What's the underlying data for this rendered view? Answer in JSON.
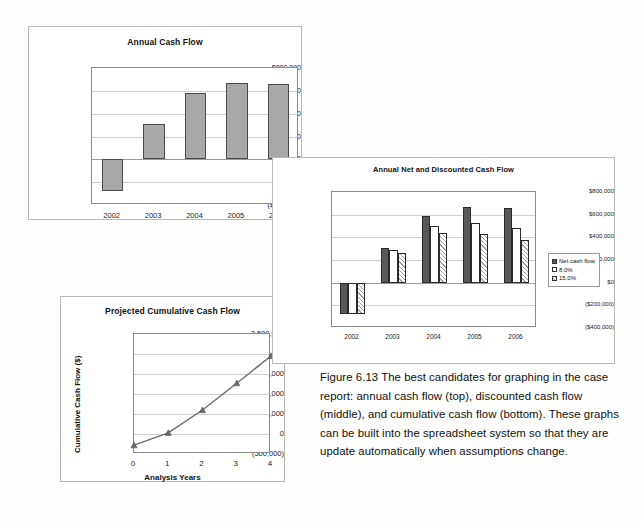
{
  "figure": {
    "caption": "Figure 6.13 The best candidates for graphing in the case report: annual cash flow (top), discounted cash flow (middle), and cumulative cash flow (bottom). These graphs can be built into the spreadsheet system so that they are update automatically when assumptions change."
  },
  "chart_data": [
    {
      "id": "annual-cash-flow",
      "type": "bar",
      "title": "Annual Cash Flow",
      "xlabel": "",
      "ylabel": "",
      "categories": [
        "2002",
        "2003",
        "2004",
        "2005",
        "2006"
      ],
      "values": [
        -280000,
        310000,
        585000,
        665000,
        660000
      ],
      "ylim": [
        -400000,
        800000
      ],
      "ytick_values": [
        800000,
        600000,
        400000,
        200000,
        0,
        -200000,
        -400000
      ],
      "ytick_labels": [
        "$800,000",
        "$600,000",
        "$400,000",
        "$200,000",
        "$0",
        "($200,000)",
        "($400,000)"
      ],
      "grid": true,
      "legend": false,
      "series_color": "#a8a8a8",
      "clipped_last_label": "200"
    },
    {
      "id": "annual-net-and-discounted-cash-flow",
      "type": "bar",
      "title": "Annual Net and Discounted Cash Flow",
      "xlabel": "",
      "ylabel": "",
      "categories": [
        "2002",
        "2003",
        "2004",
        "2005",
        "2006"
      ],
      "series": [
        {
          "name": "Net cash flow",
          "values": [
            -280000,
            310000,
            585000,
            665000,
            660000
          ],
          "color": "#595959"
        },
        {
          "name": "8.0%",
          "values": [
            -280000,
            285000,
            500000,
            525000,
            485000
          ],
          "color": "#ffffff"
        },
        {
          "name": "15.0%",
          "values": [
            -280000,
            265000,
            440000,
            430000,
            380000
          ],
          "color": "#d8d8d8"
        }
      ],
      "ylim": [
        -400000,
        800000
      ],
      "ytick_values": [
        800000,
        600000,
        400000,
        200000,
        0,
        -200000,
        -400000
      ],
      "ytick_labels": [
        "$800,000",
        "$600,000",
        "$400,000",
        "$200,000",
        "$0",
        "($200,000)",
        "($400,000)"
      ],
      "grid": true,
      "legend": true,
      "legend_position": "right"
    },
    {
      "id": "projected-cumulative-cash-flow",
      "type": "line",
      "title": "Projected Cumulative Cash Flow",
      "xlabel": "Analysis Years",
      "ylabel": "Cumulative Cash Flow ($)",
      "x": [
        0,
        1,
        2,
        3,
        4
      ],
      "xtick_labels": [
        "0",
        "1",
        "2",
        "3",
        "4"
      ],
      "values": [
        -280000,
        30000,
        600000,
        1270000,
        1950000
      ],
      "ylim": [
        -500000,
        2500000
      ],
      "ytick_values": [
        2500000,
        2000000,
        1500000,
        1000000,
        500000,
        0,
        -500000
      ],
      "ytick_labels": [
        "2,500,000",
        "2,000,000",
        "1,500,000",
        "1,000,000",
        "500,000",
        "0",
        "(500,000)"
      ],
      "grid": true,
      "legend": false,
      "line_color": "#6b6b6b",
      "marker": "triangle"
    }
  ]
}
